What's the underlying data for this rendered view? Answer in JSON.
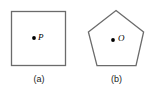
{
  "figure": {
    "canvas": {
      "width": 148,
      "height": 92,
      "background": "#ffffff"
    },
    "stroke_color": "#6b6b6b",
    "dot_color": "#000000",
    "panels": [
      {
        "id": "panel-a",
        "caption": "(a)",
        "shape": "square",
        "shape_name": "square-outline",
        "interior_point_label": "P",
        "interior_point": {
          "x": 34,
          "y": 38
        },
        "geometry": {
          "x": 11,
          "y": 11,
          "width": 55,
          "height": 55
        }
      },
      {
        "id": "panel-b",
        "caption": "(b)",
        "shape": "pentagon",
        "shape_name": "pentagon-outline",
        "interior_point_label": "O",
        "interior_point": {
          "x": 113,
          "y": 40
        },
        "geometry": {
          "points": "116,10 144,32 136,66 97,66 88,32"
        }
      }
    ]
  }
}
